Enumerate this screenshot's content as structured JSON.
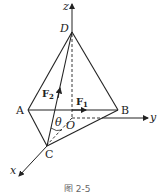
{
  "figure": {
    "axes": {
      "x": "x",
      "y": "y",
      "z": "z"
    },
    "points": {
      "A": "A",
      "B": "B",
      "C": "C",
      "D": "D",
      "O": "O"
    },
    "forces": {
      "f1": {
        "symbol": "F",
        "subscript": "1"
      },
      "f2": {
        "symbol": "F",
        "subscript": "2"
      }
    },
    "angle": "θ",
    "caption": "图 2-5"
  }
}
